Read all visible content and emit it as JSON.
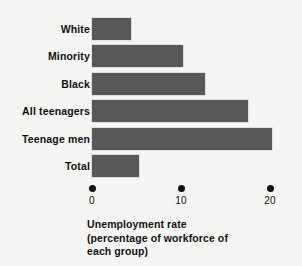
{
  "chart_data": {
    "type": "bar",
    "orientation": "horizontal",
    "title": "",
    "xlabel": "Unemployment rate (percentage of workforce of each group)",
    "ylabel": "",
    "categories": [
      "White",
      "Minority",
      "Black",
      "All teenagers",
      "Teenage men",
      "Total"
    ],
    "values": [
      4.4,
      10.2,
      12.7,
      17.5,
      20.2,
      5.3
    ],
    "xlim": [
      0,
      22
    ],
    "xticks": [
      0,
      10,
      20
    ],
    "xtick_labels": [
      "0",
      "10",
      "20"
    ],
    "grid": false,
    "legend": false,
    "bar_color": "#585858",
    "background_color": "#f5f5f3",
    "text_color": "#111111"
  },
  "axis": {
    "ticks": [
      {
        "label": "0",
        "value": 0
      },
      {
        "label": "10",
        "value": 10
      },
      {
        "label": "20",
        "value": 20
      }
    ]
  },
  "bars": [
    {
      "label": "White",
      "value": 4.4
    },
    {
      "label": "Minority",
      "value": 10.2
    },
    {
      "label": "Black",
      "value": 12.7
    },
    {
      "label": "All teenagers",
      "value": 17.5
    },
    {
      "label": "Teenage men",
      "value": 20.2
    },
    {
      "label": "Total",
      "value": 5.3
    }
  ],
  "caption": {
    "line1": "Unemployment rate",
    "line2": "(percentage of workforce of",
    "line3": "each group)"
  }
}
